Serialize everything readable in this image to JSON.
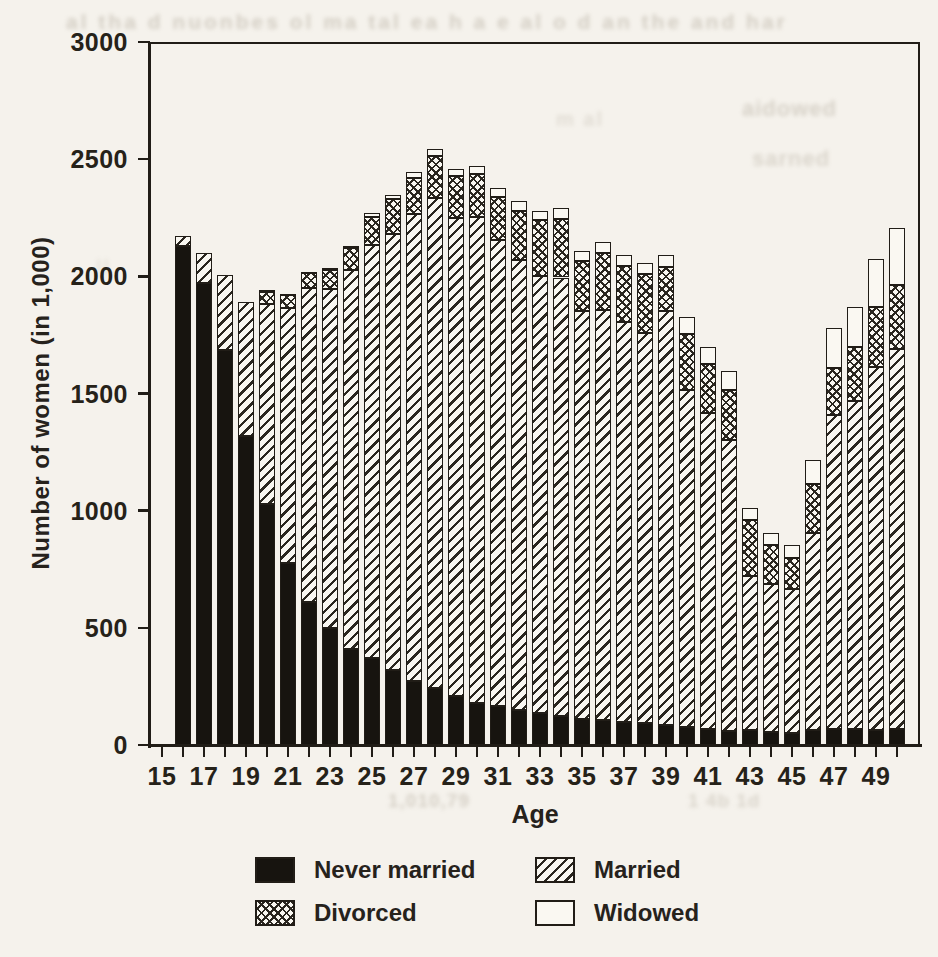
{
  "chart_data": {
    "type": "bar",
    "stacked": true,
    "title": "",
    "xlabel": "Age",
    "ylabel": "Number of women (in 1,000)",
    "x": [
      16,
      17,
      18,
      19,
      20,
      21,
      22,
      23,
      24,
      25,
      26,
      27,
      28,
      29,
      30,
      31,
      32,
      33,
      34,
      35,
      36,
      37,
      38,
      39,
      40,
      41,
      42,
      43,
      44,
      45,
      46,
      47,
      48,
      49,
      50
    ],
    "xticks": [
      15,
      16,
      17,
      18,
      19,
      20,
      21,
      22,
      23,
      24,
      25,
      26,
      27,
      28,
      29,
      30,
      31,
      32,
      33,
      34,
      35,
      36,
      37,
      38,
      39,
      40,
      41,
      42,
      43,
      44,
      45,
      46,
      47,
      48,
      49,
      50
    ],
    "xticks_labeled": [
      15,
      17,
      19,
      21,
      23,
      25,
      27,
      29,
      31,
      33,
      35,
      37,
      39,
      41,
      43,
      45,
      47,
      49
    ],
    "ylim": [
      0,
      3000
    ],
    "yticks": [
      0,
      500,
      1000,
      1500,
      2000,
      2500,
      3000
    ],
    "grid": false,
    "frame": true,
    "legend_position": "below",
    "ink_color": "#211d17",
    "paper_color": "#f5f2ec",
    "series": [
      {
        "name": "Never married",
        "pattern": "solid",
        "color": "#17140f",
        "values": [
          2130,
          1970,
          1685,
          1320,
          1030,
          775,
          610,
          500,
          410,
          370,
          320,
          275,
          245,
          210,
          180,
          165,
          150,
          135,
          125,
          110,
          105,
          100,
          95,
          85,
          75,
          70,
          60,
          65,
          55,
          50,
          65,
          70,
          70,
          65,
          70
        ]
      },
      {
        "name": "Married",
        "pattern": "hatch",
        "color": "#f9f7f1",
        "values": [
          40,
          130,
          320,
          570,
          850,
          1090,
          1340,
          1445,
          1615,
          1765,
          1860,
          1990,
          2090,
          2040,
          2075,
          1990,
          1920,
          1865,
          1870,
          1740,
          1750,
          1705,
          1665,
          1765,
          1440,
          1345,
          1240,
          655,
          630,
          615,
          840,
          1340,
          1400,
          1550,
          1620
        ]
      },
      {
        "name": "Divorced",
        "pattern": "crosshatch",
        "color": "#f9f7f1",
        "values": [
          0,
          0,
          0,
          0,
          55,
          55,
          65,
          80,
          95,
          120,
          150,
          155,
          180,
          180,
          180,
          185,
          210,
          240,
          250,
          215,
          245,
          240,
          250,
          190,
          240,
          210,
          215,
          240,
          170,
          135,
          210,
          200,
          230,
          255,
          275
        ]
      },
      {
        "name": "Widowed",
        "pattern": "plain",
        "color": "#faf8f2",
        "values": [
          0,
          0,
          0,
          0,
          5,
          5,
          5,
          10,
          10,
          15,
          15,
          25,
          30,
          30,
          35,
          35,
          40,
          40,
          45,
          45,
          45,
          45,
          45,
          50,
          70,
          75,
          80,
          50,
          50,
          55,
          100,
          170,
          170,
          205,
          240
        ]
      }
    ]
  },
  "scan_artifacts": [
    {
      "x": 66,
      "y": 10,
      "fs": 21,
      "o": 0.42,
      "ls": 3,
      "text": "al tha  d nuonbes ol ma tal  ea h a e   al  o  d  an  the  and  har"
    },
    {
      "x": 742,
      "y": 96,
      "fs": 22,
      "o": 0.38,
      "ls": 1,
      "text": "aidowed"
    },
    {
      "x": 752,
      "y": 146,
      "fs": 22,
      "o": 0.34,
      "ls": 1,
      "text": "sarned"
    },
    {
      "x": 556,
      "y": 108,
      "fs": 20,
      "o": 0.25,
      "ls": 2,
      "text": "m   al"
    },
    {
      "x": 388,
      "y": 790,
      "fs": 19,
      "o": 0.4,
      "ls": 1,
      "text": "1,010,79"
    },
    {
      "x": 688,
      "y": 790,
      "fs": 19,
      "o": 0.34,
      "ls": 1,
      "text": "1 4b 1d"
    },
    {
      "x": 96,
      "y": 256,
      "fs": 20,
      "o": 0.2,
      "ls": 2,
      "text": "ll"
    }
  ]
}
